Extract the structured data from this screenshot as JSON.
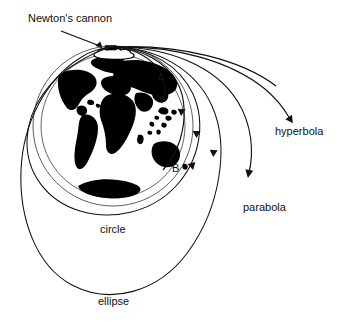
{
  "figure": {
    "background_color": "#ffffff",
    "line_color": "#111111",
    "land_color": "#000000",
    "width": 343,
    "height": 326
  },
  "labels": {
    "cannon": "Newton's cannon",
    "point_a": "A",
    "point_b": "B",
    "hyperbola": "hyperbola",
    "parabola": "parabola",
    "circle": "circle",
    "ellipse": "ellipse"
  },
  "icons": {
    "cannon": "cannon-icon",
    "mountain": "mountain-platform-icon",
    "globe": "earth-globe-icon",
    "leader_arrow": "leader-arrow-icon",
    "direction_arrow": "direction-arrowhead-icon"
  },
  "trajectories": [
    {
      "name": "suborbital-a",
      "label": "A",
      "type": "suborbital"
    },
    {
      "name": "suborbital-b",
      "label": "B",
      "type": "suborbital"
    },
    {
      "name": "circle-orbit",
      "label": "circle",
      "type": "circular"
    },
    {
      "name": "ellipse-orbit",
      "label": "ellipse",
      "type": "elliptical"
    },
    {
      "name": "parabola-escape",
      "label": "parabola",
      "type": "parabolic"
    },
    {
      "name": "hyperbola-escape",
      "label": "hyperbola",
      "type": "hyperbolic"
    }
  ]
}
